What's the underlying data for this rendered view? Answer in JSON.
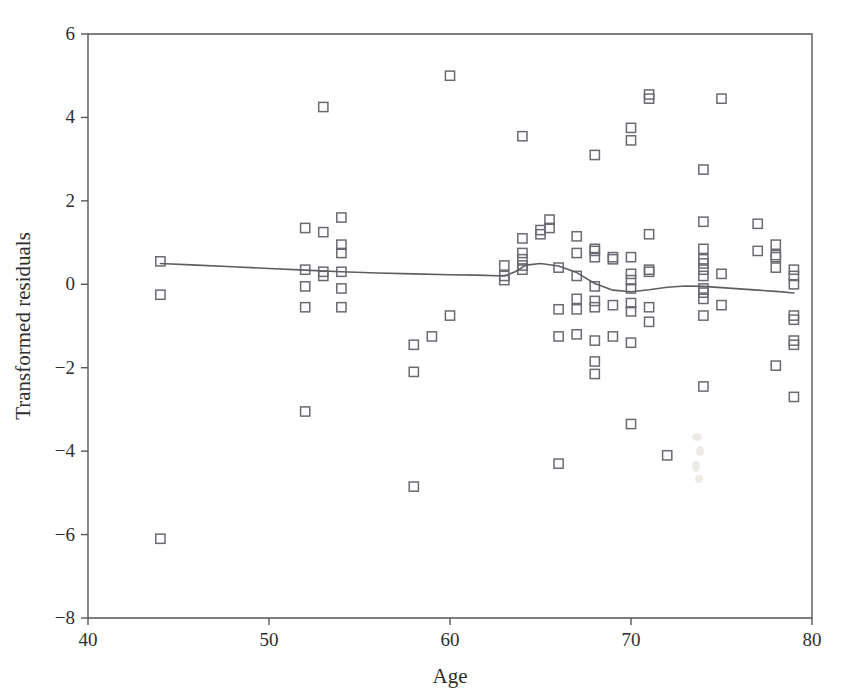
{
  "chart_data": {
    "type": "scatter",
    "title": "",
    "subtitle": "",
    "xlabel": "Age",
    "ylabel": "Transformed residuals",
    "xlim": [
      40,
      80
    ],
    "ylim": [
      -8,
      6
    ],
    "xticks": [
      40,
      50,
      60,
      70,
      80
    ],
    "yticks": [
      6,
      4,
      2,
      0,
      -2,
      -4,
      -6,
      -8
    ],
    "xtick_labels": [
      "40",
      "50",
      "60",
      "70",
      "80"
    ],
    "ytick_labels": [
      "6",
      "4",
      "2",
      "0",
      "−2",
      "−4",
      "−6",
      "−8"
    ],
    "grid": false,
    "legend": null,
    "marker_style": "open-square",
    "marker_color": "#6a6a72",
    "curve_color": "#5d5d64",
    "axis_color": "#565656",
    "background": "#ffffff",
    "series": [
      {
        "name": "Transformed residuals vs Age",
        "type": "scatter",
        "points": [
          [
            44.0,
            0.55
          ],
          [
            44.0,
            -0.25
          ],
          [
            44.0,
            -6.1
          ],
          [
            52.0,
            1.35
          ],
          [
            52.0,
            0.35
          ],
          [
            52.0,
            -0.05
          ],
          [
            52.0,
            -0.55
          ],
          [
            52.0,
            -3.05
          ],
          [
            53.0,
            4.25
          ],
          [
            53.0,
            1.25
          ],
          [
            53.0,
            0.3
          ],
          [
            53.0,
            0.2
          ],
          [
            54.0,
            1.6
          ],
          [
            54.0,
            0.95
          ],
          [
            54.0,
            0.75
          ],
          [
            54.0,
            0.3
          ],
          [
            54.0,
            -0.1
          ],
          [
            54.0,
            -0.55
          ],
          [
            58.0,
            -1.45
          ],
          [
            58.0,
            -2.1
          ],
          [
            58.0,
            -4.85
          ],
          [
            59.0,
            -1.25
          ],
          [
            60.0,
            5.0
          ],
          [
            60.0,
            -0.75
          ],
          [
            63.0,
            0.45
          ],
          [
            63.0,
            0.2
          ],
          [
            63.0,
            0.1
          ],
          [
            64.0,
            3.55
          ],
          [
            64.0,
            1.1
          ],
          [
            64.0,
            0.75
          ],
          [
            64.0,
            0.6
          ],
          [
            64.0,
            0.45
          ],
          [
            64.0,
            0.35
          ],
          [
            65.0,
            1.3
          ],
          [
            65.0,
            1.2
          ],
          [
            65.5,
            1.55
          ],
          [
            65.5,
            1.35
          ],
          [
            66.0,
            0.4
          ],
          [
            66.0,
            -0.6
          ],
          [
            66.0,
            -1.25
          ],
          [
            66.0,
            -4.3
          ],
          [
            67.0,
            1.15
          ],
          [
            67.0,
            0.75
          ],
          [
            67.0,
            0.2
          ],
          [
            67.0,
            -0.35
          ],
          [
            67.0,
            -0.6
          ],
          [
            67.0,
            -1.2
          ],
          [
            68.0,
            3.1
          ],
          [
            68.0,
            0.85
          ],
          [
            68.0,
            0.8
          ],
          [
            68.0,
            0.65
          ],
          [
            68.0,
            -0.05
          ],
          [
            68.0,
            -0.4
          ],
          [
            68.0,
            -0.55
          ],
          [
            68.0,
            -1.35
          ],
          [
            68.0,
            -1.85
          ],
          [
            68.0,
            -2.15
          ],
          [
            69.0,
            0.65
          ],
          [
            69.0,
            0.6
          ],
          [
            69.0,
            -0.5
          ],
          [
            69.0,
            -1.25
          ],
          [
            70.0,
            3.75
          ],
          [
            70.0,
            3.45
          ],
          [
            70.0,
            0.65
          ],
          [
            70.0,
            0.25
          ],
          [
            70.0,
            0.1
          ],
          [
            70.0,
            -0.1
          ],
          [
            70.0,
            -0.45
          ],
          [
            70.0,
            -0.65
          ],
          [
            70.0,
            -1.4
          ],
          [
            70.0,
            -3.35
          ],
          [
            71.0,
            4.55
          ],
          [
            71.0,
            4.45
          ],
          [
            71.0,
            1.2
          ],
          [
            71.0,
            0.35
          ],
          [
            71.0,
            0.3
          ],
          [
            71.0,
            -0.55
          ],
          [
            71.0,
            -0.9
          ],
          [
            72.0,
            -4.1
          ],
          [
            74.0,
            2.75
          ],
          [
            74.0,
            1.5
          ],
          [
            74.0,
            0.85
          ],
          [
            74.0,
            0.6
          ],
          [
            74.0,
            0.5
          ],
          [
            74.0,
            0.35
          ],
          [
            74.0,
            0.2
          ],
          [
            74.0,
            -0.1
          ],
          [
            74.0,
            -0.2
          ],
          [
            74.0,
            -0.35
          ],
          [
            74.0,
            -0.75
          ],
          [
            74.0,
            -2.45
          ],
          [
            75.0,
            4.45
          ],
          [
            75.0,
            0.25
          ],
          [
            75.0,
            -0.5
          ],
          [
            77.0,
            1.45
          ],
          [
            77.0,
            0.8
          ],
          [
            78.0,
            0.95
          ],
          [
            78.0,
            0.7
          ],
          [
            78.0,
            0.65
          ],
          [
            78.0,
            0.4
          ],
          [
            78.0,
            -1.95
          ],
          [
            79.0,
            0.35
          ],
          [
            79.0,
            0.2
          ],
          [
            79.0,
            0.0
          ],
          [
            79.0,
            -0.75
          ],
          [
            79.0,
            -0.85
          ],
          [
            79.0,
            -1.35
          ],
          [
            79.0,
            -1.45
          ],
          [
            79.0,
            -2.7
          ]
        ]
      },
      {
        "name": "smoothed trend",
        "type": "line",
        "points": [
          [
            44.0,
            0.5
          ],
          [
            46.0,
            0.46
          ],
          [
            48.0,
            0.42
          ],
          [
            50.0,
            0.38
          ],
          [
            52.0,
            0.34
          ],
          [
            54.0,
            0.3
          ],
          [
            56.0,
            0.27
          ],
          [
            58.0,
            0.25
          ],
          [
            60.0,
            0.23
          ],
          [
            61.5,
            0.22
          ],
          [
            63.0,
            0.2
          ],
          [
            63.6,
            0.3
          ],
          [
            64.2,
            0.46
          ],
          [
            65.0,
            0.5
          ],
          [
            66.0,
            0.44
          ],
          [
            67.0,
            0.28
          ],
          [
            68.0,
            0.02
          ],
          [
            69.0,
            -0.14
          ],
          [
            70.0,
            -0.18
          ],
          [
            71.0,
            -0.13
          ],
          [
            72.0,
            -0.07
          ],
          [
            73.0,
            -0.04
          ],
          [
            74.0,
            -0.05
          ],
          [
            75.0,
            -0.08
          ],
          [
            76.0,
            -0.11
          ],
          [
            77.0,
            -0.14
          ],
          [
            78.0,
            -0.17
          ],
          [
            79.0,
            -0.21
          ]
        ]
      }
    ]
  }
}
